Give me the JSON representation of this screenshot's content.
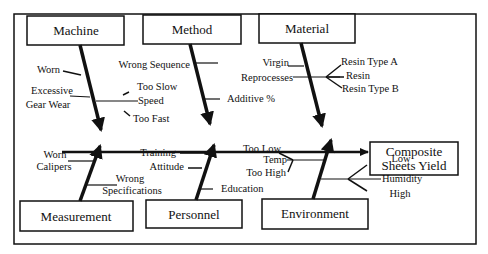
{
  "diagram": {
    "type": "fishbone",
    "effect": {
      "line1": "Composite",
      "line2": "Sheets Yield"
    },
    "categories": {
      "machine": {
        "label": "Machine",
        "causes": [
          "Worn",
          "Excessive",
          "Gear Wear",
          "Too Slow",
          "Speed",
          "Too Fast"
        ]
      },
      "method": {
        "label": "Method",
        "causes": [
          "Wrong Sequence",
          "Additive %"
        ]
      },
      "material": {
        "label": "Material",
        "causes": [
          "Virgin",
          "Reprocesses",
          "Resin Type A",
          "Resin",
          "Resin Type B"
        ]
      },
      "measurement": {
        "label": "Measurement",
        "causes": [
          "Worn",
          "Calipers",
          "Wrong",
          "Specifications"
        ]
      },
      "personnel": {
        "label": "Personnel",
        "causes": [
          "Training",
          "Attitude",
          "Education"
        ]
      },
      "environment": {
        "label": "Environment",
        "causes": [
          "Too Low",
          "Temp",
          "Too High",
          "Low",
          "Humidity",
          "High"
        ]
      }
    },
    "colors": {
      "line": "#111111",
      "background": "#ffffff"
    }
  }
}
